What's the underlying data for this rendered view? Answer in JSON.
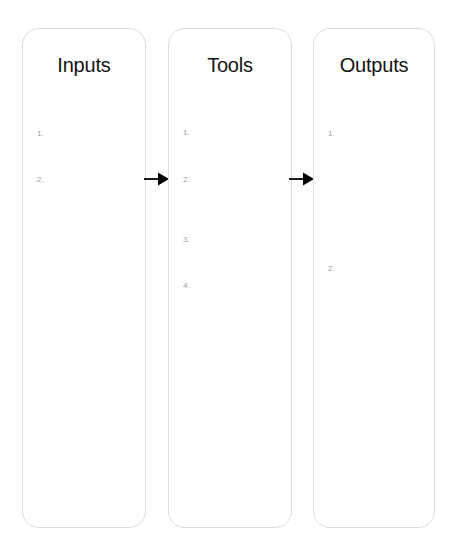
{
  "diagram": {
    "background_color": "#ffffff",
    "card_border_color": "#dcdcdc",
    "title_color": "#141414",
    "marker_color": "#9d9d9d",
    "arrow_color": "#000000",
    "columns": [
      {
        "id": "inputs",
        "title": "Inputs",
        "items": [
          {
            "marker": "1.",
            "text": "",
            "top": 101
          },
          {
            "marker": "2.",
            "text": "",
            "top": 147
          }
        ]
      },
      {
        "id": "tools",
        "title": "Tools",
        "items": [
          {
            "marker": "1.",
            "text": "",
            "top": 100
          },
          {
            "marker": "2.",
            "text": "",
            "top": 147
          },
          {
            "marker": "3.",
            "text": "",
            "top": 207
          },
          {
            "marker": "4.",
            "text": "",
            "top": 253
          }
        ]
      },
      {
        "id": "outputs",
        "title": "Outputs",
        "items": [
          {
            "marker": "1.",
            "text": "",
            "top": 101
          },
          {
            "marker": "2.",
            "text": "",
            "top": 236
          }
        ]
      }
    ],
    "arrows": [
      {
        "id": "arrow-inputs-to-tools",
        "from": "inputs",
        "to": "tools",
        "label": ""
      },
      {
        "id": "arrow-tools-to-outputs",
        "from": "tools",
        "to": "outputs",
        "label": ""
      }
    ]
  }
}
